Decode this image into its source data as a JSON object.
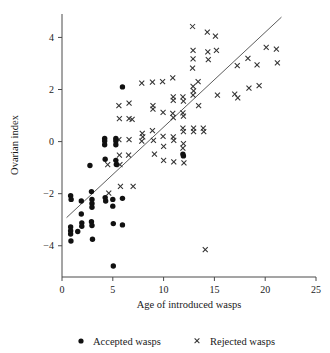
{
  "chart_data": {
    "type": "scatter",
    "title": "",
    "xlabel": "Age of introduced wasps",
    "ylabel": "Ovarian index",
    "xlim": [
      0,
      25
    ],
    "ylim": [
      -5.2,
      4.9
    ],
    "xticks": [
      0,
      5,
      10,
      15,
      20,
      25
    ],
    "yticks": [
      -4,
      -2,
      0,
      2,
      4
    ],
    "xtick_labels": [
      "0",
      "5",
      "10",
      "15",
      "20",
      "25"
    ],
    "ytick_labels": [
      "−4",
      "−2",
      "0",
      "2",
      "4"
    ],
    "grid": false,
    "legend_position": "bottom",
    "legend": [
      {
        "name": "Accepted wasps",
        "marker": "dot-marker"
      },
      {
        "name": "Rejected wasps",
        "marker": "cross-marker"
      }
    ],
    "trendline": {
      "name": "regression-line",
      "x_start": 0.45,
      "y_start": -2.92,
      "x_end": 21.6,
      "y_end": 4.78
    },
    "series": [
      {
        "name": "Accepted wasps",
        "marker": "dot-marker",
        "points": [
          [
            0.85,
            -2.08
          ],
          [
            0.9,
            -2.22
          ],
          [
            0.85,
            -3.28
          ],
          [
            0.85,
            -3.42
          ],
          [
            0.85,
            -3.55
          ],
          [
            0.88,
            -3.82
          ],
          [
            1.55,
            -3.45
          ],
          [
            1.9,
            -2.28
          ],
          [
            1.9,
            -2.78
          ],
          [
            1.95,
            -3.12
          ],
          [
            1.95,
            -3.25
          ],
          [
            2.9,
            -1.92
          ],
          [
            2.95,
            -2.22
          ],
          [
            2.95,
            -2.38
          ],
          [
            2.95,
            -2.52
          ],
          [
            2.9,
            -3.08
          ],
          [
            2.95,
            -3.22
          ],
          [
            3.0,
            -3.75
          ],
          [
            2.75,
            -0.92
          ],
          [
            4.2,
            0.12
          ],
          [
            4.2,
            0.02
          ],
          [
            4.2,
            -0.12
          ],
          [
            4.25,
            -0.68
          ],
          [
            4.25,
            -2.15
          ],
          [
            4.3,
            -2.28
          ],
          [
            5.0,
            -2.22
          ],
          [
            5.0,
            -2.48
          ],
          [
            5.05,
            -3.15
          ],
          [
            5.05,
            -4.78
          ],
          [
            5.3,
            0.12
          ],
          [
            5.3,
            0.02
          ],
          [
            5.3,
            -0.12
          ],
          [
            5.3,
            -0.72
          ],
          [
            5.35,
            -0.88
          ],
          [
            5.95,
            2.1
          ],
          [
            5.95,
            -2.18
          ],
          [
            5.95,
            -3.2
          ],
          [
            11.9,
            -0.48
          ],
          [
            11.95,
            -0.55
          ]
        ]
      },
      {
        "name": "Rejected wasps",
        "marker": "cross-marker",
        "points": [
          [
            4.5,
            -0.88
          ],
          [
            4.6,
            -1.98
          ],
          [
            5.6,
            1.38
          ],
          [
            5.65,
            0.88
          ],
          [
            5.6,
            0.08
          ],
          [
            5.65,
            -0.52
          ],
          [
            5.7,
            -0.88
          ],
          [
            5.75,
            -1.72
          ],
          [
            6.6,
            1.48
          ],
          [
            6.6,
            0.88
          ],
          [
            6.6,
            0.08
          ],
          [
            6.55,
            -0.52
          ],
          [
            6.9,
            0.85
          ],
          [
            7.0,
            -1.72
          ],
          [
            7.85,
            2.25
          ],
          [
            7.9,
            0.32
          ],
          [
            7.95,
            0.18
          ],
          [
            7.85,
            0.02
          ],
          [
            8.9,
            2.28
          ],
          [
            8.95,
            1.38
          ],
          [
            8.95,
            1.25
          ],
          [
            8.9,
            0.42
          ],
          [
            9.0,
            0.05
          ],
          [
            9.1,
            -0.48
          ],
          [
            9.9,
            2.3
          ],
          [
            9.95,
            1.12
          ],
          [
            9.95,
            0.2
          ],
          [
            10.0,
            -0.18
          ],
          [
            10.0,
            -0.72
          ],
          [
            10.9,
            2.45
          ],
          [
            10.95,
            1.72
          ],
          [
            10.95,
            1.58
          ],
          [
            10.9,
            1.08
          ],
          [
            10.95,
            0.92
          ],
          [
            10.95,
            0.18
          ],
          [
            11.0,
            0.05
          ],
          [
            11.0,
            -0.78
          ],
          [
            11.9,
            1.72
          ],
          [
            11.95,
            1.55
          ],
          [
            11.9,
            1.1
          ],
          [
            11.95,
            0.98
          ],
          [
            11.9,
            0.52
          ],
          [
            11.95,
            0.38
          ],
          [
            11.95,
            -0.08
          ],
          [
            11.9,
            -0.25
          ],
          [
            12.0,
            -0.82
          ],
          [
            12.85,
            4.42
          ],
          [
            12.9,
            3.5
          ],
          [
            12.9,
            3.18
          ],
          [
            12.85,
            2.82
          ],
          [
            12.9,
            2.12
          ],
          [
            12.95,
            1.95
          ],
          [
            12.9,
            1.78
          ],
          [
            12.95,
            0.52
          ],
          [
            12.95,
            0.38
          ],
          [
            13.4,
            2.3
          ],
          [
            13.45,
            1.38
          ],
          [
            13.9,
            0.52
          ],
          [
            13.95,
            0.38
          ],
          [
            14.1,
            -4.15
          ],
          [
            14.3,
            4.2
          ],
          [
            14.35,
            3.45
          ],
          [
            14.4,
            3.15
          ],
          [
            15.1,
            4.05
          ],
          [
            15.2,
            3.5
          ],
          [
            15.3,
            1.78
          ],
          [
            17.0,
            1.82
          ],
          [
            17.3,
            1.68
          ],
          [
            17.25,
            2.92
          ],
          [
            18.3,
            3.2
          ],
          [
            18.4,
            2.05
          ],
          [
            19.2,
            2.95
          ],
          [
            19.4,
            2.15
          ],
          [
            20.1,
            3.62
          ],
          [
            21.1,
            3.55
          ],
          [
            21.2,
            3.02
          ]
        ]
      }
    ]
  }
}
